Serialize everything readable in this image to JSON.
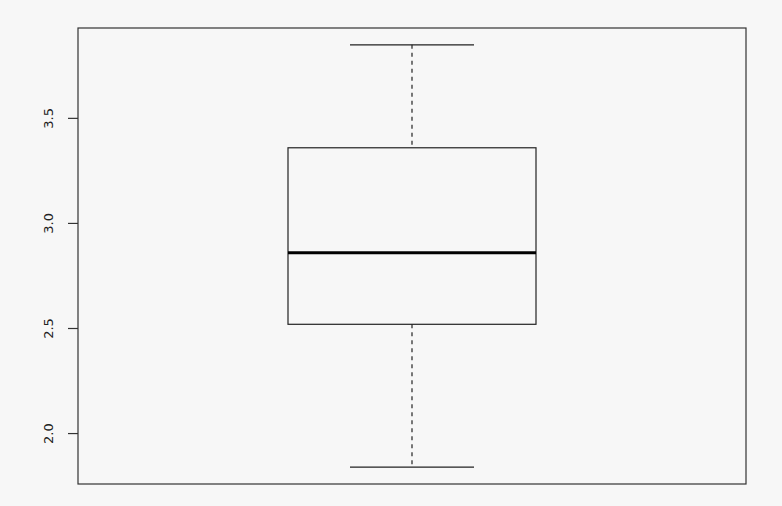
{
  "chart_data": {
    "type": "boxplot",
    "title": "",
    "xlabel": "",
    "ylabel": "",
    "ylim": [
      1.76,
      3.93
    ],
    "y_ticks": [
      2.0,
      2.5,
      3.0,
      3.5
    ],
    "y_tick_labels": [
      "2.0",
      "2.5",
      "3.0",
      "3.5"
    ],
    "grid": false,
    "legend": null,
    "series": [
      {
        "name": "",
        "min": 1.84,
        "q1": 2.52,
        "median": 2.86,
        "q3": 3.36,
        "max": 3.85,
        "outliers": []
      }
    ]
  },
  "colors": {
    "background": "#f7f7f7",
    "stroke": "#222222",
    "median": "#000000"
  }
}
